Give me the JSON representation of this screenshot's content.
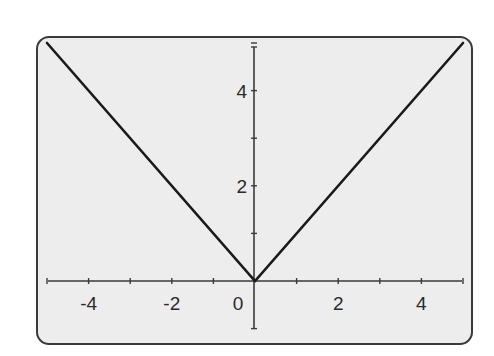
{
  "chart_data": {
    "type": "line",
    "title": "",
    "xlabel": "",
    "ylabel": "",
    "function": "y = |x|",
    "xlim": [
      -5,
      5
    ],
    "ylim": [
      -1,
      5
    ],
    "grid": false,
    "legend": null,
    "series": [
      {
        "name": "y = |x|",
        "x": [
          -5,
          0,
          5
        ],
        "y": [
          5,
          0,
          5
        ],
        "color": "#1a1a1a"
      }
    ],
    "x_ticks": [
      -5,
      -4,
      -3,
      -2,
      -1,
      0,
      1,
      2,
      3,
      4,
      5
    ],
    "x_tick_labels": [
      {
        "value": -4,
        "label": "-4"
      },
      {
        "value": -2,
        "label": "-2"
      },
      {
        "value": 0,
        "label": "0"
      },
      {
        "value": 2,
        "label": "2"
      },
      {
        "value": 4,
        "label": "4"
      }
    ],
    "y_ticks": [
      -1,
      1,
      2,
      3,
      4,
      5
    ],
    "y_tick_labels": [
      {
        "value": 2,
        "label": "2"
      },
      {
        "value": 4,
        "label": "4"
      }
    ]
  },
  "style": {
    "frame_fill": "#ededed",
    "frame_stroke": "#3a3a3a",
    "axis_color": "#3a3a3a",
    "line_color": "#1a1a1a"
  }
}
